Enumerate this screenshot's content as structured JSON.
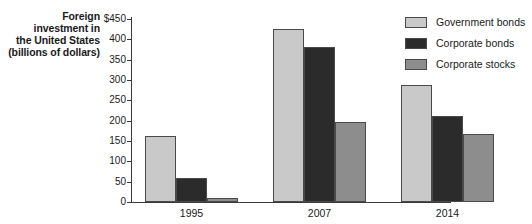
{
  "chart_data": {
    "type": "bar",
    "title": "Foreign investment in the United States (billions of dollars)",
    "title_lines": [
      "Foreign",
      "investment in",
      "the United States",
      "(billions of dollars)"
    ],
    "xlabel": "",
    "ylabel": "Foreign investment in the United States (billions of dollars)",
    "categories": [
      "1995",
      "2007",
      "2014"
    ],
    "series": [
      {
        "name": "Government bonds",
        "values": [
          163,
          425,
          288
        ],
        "color": "#c9c9c9"
      },
      {
        "name": "Corporate bonds",
        "values": [
          58,
          382,
          212
        ],
        "color": "#2b2b2b"
      },
      {
        "name": "Corporate stocks",
        "values": [
          11,
          196,
          167
        ],
        "color": "#8d8d8d"
      }
    ],
    "ylim": [
      0,
      450
    ],
    "ytick_step": 50,
    "yticks": [
      0,
      50,
      100,
      150,
      200,
      250,
      300,
      350,
      400,
      450
    ],
    "ytick_labels": [
      "0",
      "50",
      "100",
      "150",
      "200",
      "250",
      "300",
      "350",
      "400",
      "$450"
    ],
    "currency_symbol": "$",
    "grid": false,
    "legend_position": "top-right",
    "axis_color": "#3a3a3a",
    "bar_border_color": "#4a4a4a",
    "background_color": "#ffffff"
  }
}
